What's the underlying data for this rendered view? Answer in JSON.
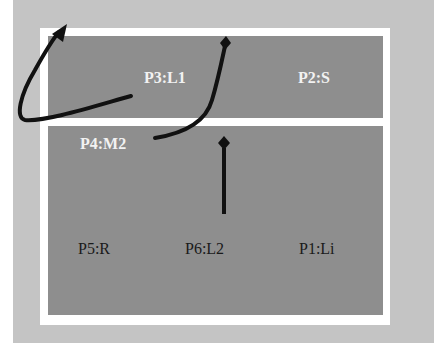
{
  "diagram": {
    "type": "room-layout",
    "upper_row": [
      {
        "id": "P3",
        "label": "P3:L1"
      },
      {
        "id": "P2",
        "label": "P2:S"
      }
    ],
    "middle_label": {
      "id": "P4",
      "label": "P4:M2"
    },
    "lower_row": [
      {
        "id": "P5",
        "label": "P5:R"
      },
      {
        "id": "P6",
        "label": "P6:L2"
      },
      {
        "id": "P1",
        "label": "P1:Li"
      }
    ],
    "connectors": [
      {
        "from": "P3",
        "to": "outside-top-left",
        "style": "curved-arrow"
      },
      {
        "from": "P4",
        "to": "top-wall",
        "style": "curved-line-diamond-end"
      },
      {
        "from": "P6",
        "to": "divider",
        "style": "straight-line-diamond-end"
      }
    ],
    "colors": {
      "background": "#c4c4c4",
      "frame": "#ffffff",
      "panel": "#8e8e8e",
      "connector": "#111111"
    }
  }
}
